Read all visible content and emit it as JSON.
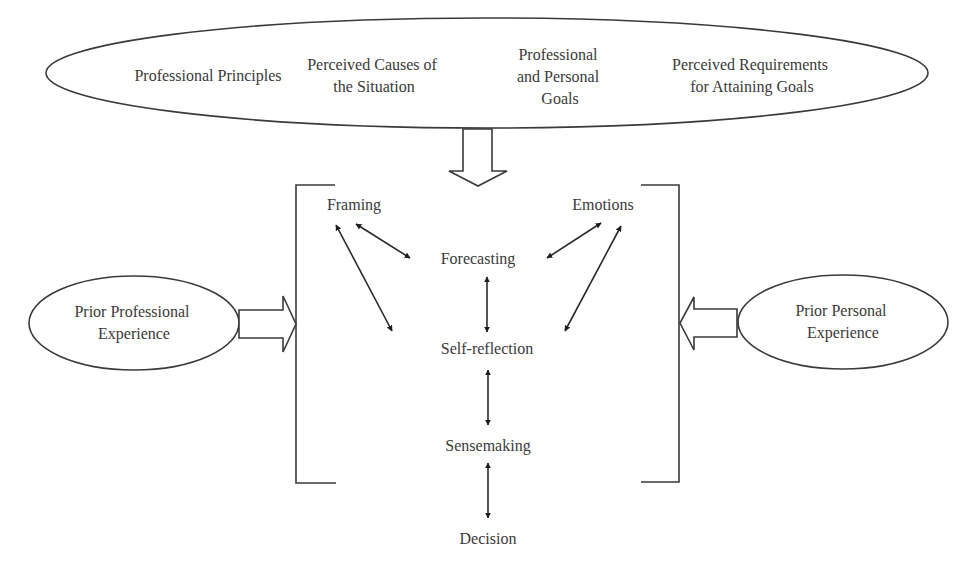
{
  "top_ellipse": {
    "items": [
      {
        "lines": [
          "Professional Principles"
        ]
      },
      {
        "lines": [
          "Perceived Causes of",
          "the Situation"
        ]
      },
      {
        "lines": [
          "Professional",
          "and Personal",
          "Goals"
        ]
      },
      {
        "lines": [
          "Perceived Requirements",
          "for Attaining Goals"
        ]
      }
    ]
  },
  "left_ellipse": {
    "lines": [
      "Prior Professional",
      "Experience"
    ]
  },
  "right_ellipse": {
    "lines": [
      "Prior Personal",
      "Experience"
    ]
  },
  "nodes": {
    "framing": "Framing",
    "emotions": "Emotions",
    "forecasting": "Forecasting",
    "self_reflection": "Self-reflection",
    "sensemaking": "Sensemaking",
    "decision": "Decision"
  },
  "colors": {
    "stroke": "#3a3a3a",
    "text": "#3a3a3a",
    "background": "#ffffff"
  }
}
